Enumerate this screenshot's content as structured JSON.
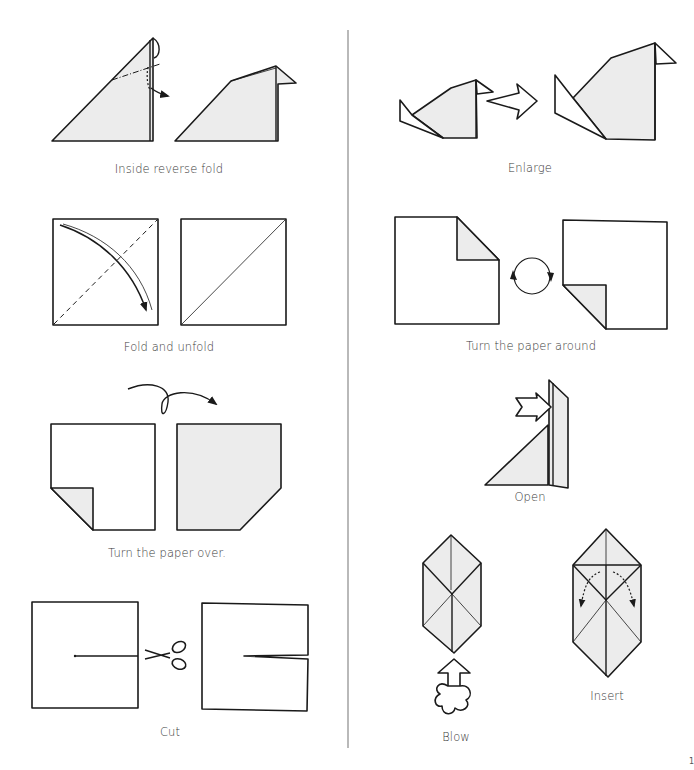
{
  "page": {
    "page_number": "1",
    "layout": "two-column origami symbol key"
  },
  "left_column": [
    {
      "id": "inside-reverse-fold",
      "caption": "Inside reverse fold"
    },
    {
      "id": "fold-and-unfold",
      "caption": "Fold and unfold"
    },
    {
      "id": "turn-paper-over",
      "caption": "Turn the paper over."
    },
    {
      "id": "cut",
      "caption": "Cut"
    }
  ],
  "right_column": [
    {
      "id": "enlarge",
      "caption": "Enlarge"
    },
    {
      "id": "turn-paper-around",
      "caption": "Turn the paper around"
    },
    {
      "id": "open",
      "caption": "Open"
    },
    {
      "id": "blow",
      "caption": "Blow"
    },
    {
      "id": "insert",
      "caption": "Insert"
    }
  ],
  "colors": {
    "line": "#1a1a1a",
    "shade": "#ececec",
    "divider": "#8a8a8a",
    "background": "#ffffff"
  }
}
